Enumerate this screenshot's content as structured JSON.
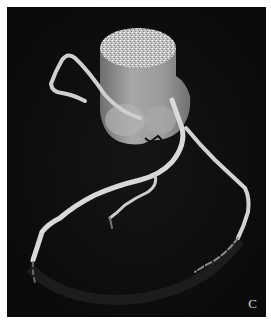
{
  "figure": {
    "panel_label": "C",
    "colors": {
      "background": "#0c0c0c",
      "border": "#ffffff",
      "vessel": "#d6d6d6",
      "aorta": "#9a9a9a",
      "aorta_top": "#cfcfcf"
    }
  }
}
